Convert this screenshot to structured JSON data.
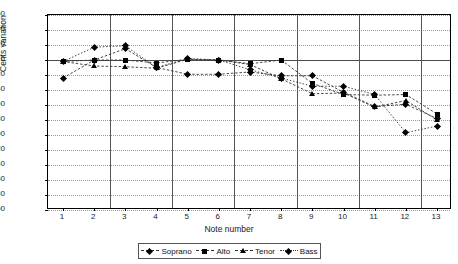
{
  "chart_data": {
    "type": "line",
    "title": "",
    "xlabel": "Note number",
    "ylabel": "Cents variation",
    "ylim": [
      -200,
      60
    ],
    "ytick_step": 20,
    "yticks": [
      60,
      40,
      20,
      0,
      "−20",
      "−40",
      "−60",
      "−80",
      "−100",
      "−120",
      "−140",
      "−160",
      "−180",
      "−200"
    ],
    "ytick_values": [
      60,
      40,
      20,
      0,
      -20,
      -40,
      -60,
      -80,
      -100,
      -120,
      -140,
      -160,
      -180,
      -200
    ],
    "categories": [
      1,
      2,
      3,
      4,
      5,
      6,
      7,
      8,
      9,
      10,
      11,
      12,
      13
    ],
    "xtick_labels": [
      "1",
      "2",
      "3",
      "4",
      "5",
      "6",
      "7",
      "8",
      "9",
      "10",
      "11",
      "12",
      "13"
    ],
    "grid": "horizontal-dotted",
    "group_separators_after": [
      2,
      4,
      6,
      8,
      10,
      12
    ],
    "legend_position": "bottom",
    "series": [
      {
        "name": "Soprano",
        "marker": "diamond",
        "line": "dashed",
        "values": [
          -24,
          0,
          15,
          -10,
          -19,
          -19,
          -16,
          -21,
          -21,
          -43,
          -62,
          -59,
          -78
        ]
      },
      {
        "name": "Alto",
        "marker": "square",
        "line": "dashed",
        "values": [
          -2,
          0,
          0,
          -4,
          1,
          0,
          -5,
          0,
          -31,
          -46,
          -47,
          -46,
          -72
        ]
      },
      {
        "name": "Tenor",
        "marker": "triangle",
        "line": "dashed",
        "values": [
          -2,
          -8,
          -9,
          -11,
          1,
          0,
          -6,
          -25,
          -45,
          -44,
          -63,
          -54,
          -80
        ]
      },
      {
        "name": "Bass",
        "marker": "diamond-dotted",
        "line": "dotted",
        "values": [
          -2,
          17,
          19,
          -10,
          2,
          0,
          -13,
          -24,
          -35,
          -35,
          -46,
          -97,
          -88
        ]
      }
    ]
  },
  "colors": {
    "ink": "#000000",
    "grid": "#9a9a9a",
    "separator": "#555555",
    "axis": "#4a4a4a"
  }
}
